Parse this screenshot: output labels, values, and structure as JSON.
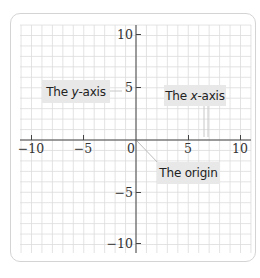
{
  "diagram": {
    "type": "coordinate-plane",
    "x_range": [
      -10,
      10
    ],
    "y_range": [
      -10,
      10
    ],
    "grid": true,
    "x_tick_labels": [
      "-10",
      "-5",
      "0",
      "5",
      "10"
    ],
    "y_tick_labels": [
      "10",
      "5",
      "-5",
      "-10"
    ],
    "callouts": {
      "y_axis": {
        "prefix": "The ",
        "var": "y",
        "suffix": "-axis"
      },
      "x_axis": {
        "prefix": "The ",
        "var": "x",
        "suffix": "-axis"
      },
      "origin": {
        "text": "The origin"
      }
    },
    "colors": {
      "grid": "#d9d9d9",
      "axis": "#444444",
      "callout_bg": "#e8e8e8",
      "leader": "#c8c8c8"
    }
  },
  "ticks": {
    "x": {
      "n10": "−10",
      "n5": "−5",
      "zero": "0",
      "p5": "5",
      "p10": "10"
    },
    "y": {
      "p10": "10",
      "p5": "5",
      "n5": "−5",
      "n10": "−10"
    }
  }
}
